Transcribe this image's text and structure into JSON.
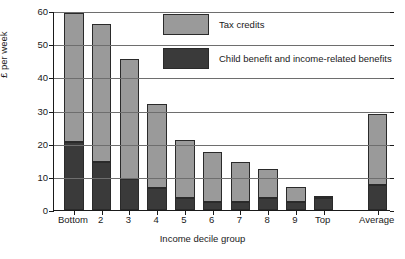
{
  "chart_data": {
    "type": "bar",
    "subtype": "stacked-vertical",
    "title": "",
    "xlabel": "Income decile group",
    "ylabel": "£ per week",
    "ylim": [
      0,
      60
    ],
    "yticks": [
      0,
      10,
      20,
      30,
      40,
      50,
      60
    ],
    "ytick_labels": [
      "0",
      "10",
      "20",
      "30",
      "40",
      "50",
      "60"
    ],
    "grid": "horizontal",
    "legend_position": "upper-center",
    "categories": [
      "Bottom",
      "2",
      "3",
      "4",
      "5",
      "6",
      "7",
      "8",
      "9",
      "Top",
      "Average"
    ],
    "series": [
      {
        "name": "Child benefit and income-related benefits",
        "color": "#3a3a3a",
        "values": [
          20.5,
          14.5,
          9.5,
          6.5,
          3.5,
          2.5,
          2.5,
          3.5,
          2.5,
          3.5,
          7.5
        ]
      },
      {
        "name": "Tax credits",
        "color": "#9a9a9a",
        "values": [
          39.0,
          41.5,
          36.0,
          25.5,
          17.5,
          15.0,
          12.0,
          9.0,
          4.5,
          0.5,
          21.5
        ]
      }
    ],
    "totals": [
      59.5,
      56.0,
      45.5,
      32.0,
      21.0,
      17.5,
      14.5,
      12.5,
      7.0,
      4.0,
      29.0
    ],
    "legend": [
      {
        "label": "Tax credits",
        "color": "#9a9a9a"
      },
      {
        "label": "Child benefit and income-related benefits",
        "color": "#3a3a3a"
      }
    ]
  }
}
